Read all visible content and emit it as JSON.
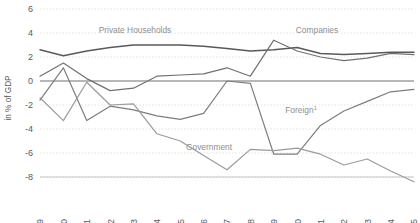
{
  "chart_data": {
    "type": "line",
    "title": "",
    "subtitle": "",
    "xlabel": "",
    "ylabel": "in % of GDP",
    "x": [
      1999,
      2000,
      2001,
      2002,
      2003,
      2004,
      2005,
      2006,
      2007,
      2008,
      2009,
      2010,
      2011,
      2012,
      2013,
      2014,
      2015
    ],
    "categories": [
      "1999",
      "2000",
      "2001",
      "2002",
      "2003",
      "2004",
      "2005",
      "2006",
      "2007",
      "2008",
      "2009",
      "2010",
      "2011",
      "2012",
      "2013",
      "2014",
      "2015"
    ],
    "xlim": [
      1999,
      2015
    ],
    "ylim": [
      -8,
      6
    ],
    "yticks": [
      6,
      4,
      2,
      0,
      -2,
      -4,
      -6,
      -8
    ],
    "ytick_labels": [
      "6",
      "4",
      "2",
      "0",
      "-2",
      "-4",
      "-6",
      "-8"
    ],
    "grid": true,
    "grid_axis": "y",
    "legend": "inline-annotations",
    "legend_position": "none",
    "series": [
      {
        "name": "Private Households",
        "color": "#58595b",
        "width": 1.5,
        "values": [
          2.6,
          2.1,
          2.5,
          2.8,
          3.0,
          3.0,
          3.0,
          2.9,
          2.7,
          2.5,
          2.6,
          2.8,
          2.3,
          2.2,
          2.3,
          2.4,
          2.4
        ]
      },
      {
        "name": "Companies",
        "color": "#6f7072",
        "width": 1.2,
        "values": [
          0.4,
          1.5,
          0.2,
          -0.8,
          -0.6,
          0.4,
          0.5,
          0.6,
          1.1,
          0.4,
          3.4,
          2.5,
          2.0,
          1.7,
          1.9,
          2.3,
          2.2
        ]
      },
      {
        "name": "Government",
        "color": "#7c7d7f",
        "width": 1.2,
        "values": [
          -1.6,
          1.1,
          -3.3,
          -2.1,
          -2.4,
          -2.9,
          -3.2,
          -2.7,
          0.0,
          -0.2,
          -6.1,
          -6.1,
          -3.7,
          -2.5,
          -1.7,
          -0.9,
          -0.7
        ]
      },
      {
        "name": "Foreign",
        "color": "#9a9b9d",
        "width": 1.2,
        "values": [
          -1.4,
          -3.3,
          -0.1,
          -2.0,
          -1.9,
          -4.4,
          -5.0,
          -6.2,
          -7.4,
          -5.7,
          -5.8,
          -5.6,
          -6.1,
          -7.0,
          -6.5,
          -7.5,
          -8.4
        ],
        "note_superscript": "1"
      }
    ],
    "annotations": [
      {
        "name": "private-households-label",
        "text": "Private Households",
        "x_px": 135,
        "y_px": 33
      },
      {
        "name": "companies-label",
        "text": "Companies",
        "x_px": 317,
        "y_px": 33
      },
      {
        "name": "government-label",
        "text": "Government",
        "x_px": 209,
        "y_px": 150
      },
      {
        "name": "foreign-label",
        "text": "Foreign",
        "superscript": "1",
        "x_px": 301,
        "y_px": 113
      }
    ],
    "colors": {
      "private_households": "#58595b",
      "companies": "#6f7072",
      "government": "#7c7d7f",
      "foreign": "#9a9b9d",
      "gridline": "#d8d8d8",
      "zeroline": "#6f7072",
      "tick_text": "#5a5b5d",
      "annotation_text": "#8e8f91",
      "background": "#ffffff"
    }
  }
}
